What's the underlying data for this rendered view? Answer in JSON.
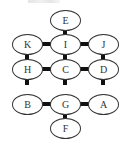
{
  "diagram": {
    "type": "graph",
    "nodes": [
      {
        "id": "E",
        "label": "E",
        "row": 0,
        "col": 1
      },
      {
        "id": "K",
        "label": "K",
        "row": 1,
        "col": 0
      },
      {
        "id": "I",
        "label": "I",
        "row": 1,
        "col": 1
      },
      {
        "id": "J",
        "label": "J",
        "row": 1,
        "col": 2
      },
      {
        "id": "H",
        "label": "H",
        "row": 2,
        "col": 0
      },
      {
        "id": "C",
        "label": "C",
        "row": 2,
        "col": 1
      },
      {
        "id": "D",
        "label": "D",
        "row": 2,
        "col": 2
      },
      {
        "id": "B",
        "label": "B",
        "row": 3,
        "col": 0
      },
      {
        "id": "G",
        "label": "G",
        "row": 3,
        "col": 1
      },
      {
        "id": "A",
        "label": "A",
        "row": 3,
        "col": 2
      },
      {
        "id": "F",
        "label": "F",
        "row": 4,
        "col": 1
      }
    ],
    "edges": [
      [
        "E",
        "I"
      ],
      [
        "K",
        "I"
      ],
      [
        "I",
        "J"
      ],
      [
        "K",
        "H"
      ],
      [
        "I",
        "C"
      ],
      [
        "J",
        "D"
      ],
      [
        "H",
        "C"
      ],
      [
        "C",
        "D"
      ],
      [
        "H",
        "B"
      ],
      [
        "C",
        "G"
      ],
      [
        "D",
        "A"
      ],
      [
        "B",
        "G"
      ],
      [
        "G",
        "A"
      ],
      [
        "G",
        "F"
      ]
    ]
  }
}
